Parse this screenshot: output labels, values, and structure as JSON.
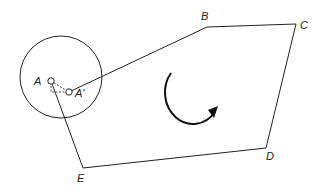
{
  "diagram": {
    "labels": {
      "A": "A",
      "A_prime": "A'",
      "B": "B",
      "C": "C",
      "D": "D",
      "E": "E"
    },
    "polygon": [
      "A'",
      "B",
      "C",
      "D",
      "E",
      "A"
    ],
    "rotation_arrow": "clockwise",
    "colors": {
      "stroke": "#222222",
      "background": "#ffffff"
    }
  }
}
